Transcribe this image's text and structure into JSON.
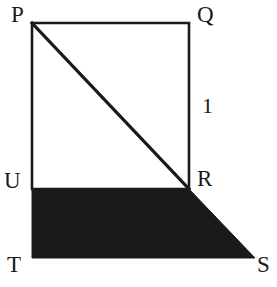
{
  "figure": {
    "canvas": {
      "width": 277,
      "height": 287,
      "background": "#ffffff"
    },
    "stroke_color": "#1a1a1a",
    "fill_color": "#1a1a1a",
    "stroke_width": 2.6,
    "diagonal_stroke_width": 3.2,
    "labels": {
      "P": "P",
      "Q": "Q",
      "R": "R",
      "S": "S",
      "T": "T",
      "U": "U",
      "side_length": "1"
    },
    "points": {
      "P": {
        "x": 32,
        "y": 23
      },
      "Q": {
        "x": 189,
        "y": 23
      },
      "R": {
        "x": 189,
        "y": 189
      },
      "U": {
        "x": 32,
        "y": 189
      },
      "T": {
        "x": 32,
        "y": 258
      },
      "S": {
        "x": 255,
        "y": 258
      }
    },
    "shapes": {
      "rectangle_outline": "32,23 189,23 189,189 32,189",
      "diagonal": {
        "x1": 32,
        "y1": 23,
        "x2": 189,
        "y2": 189
      },
      "shaded_polygon": "32,189 189,189 255,258 32,258"
    }
  }
}
